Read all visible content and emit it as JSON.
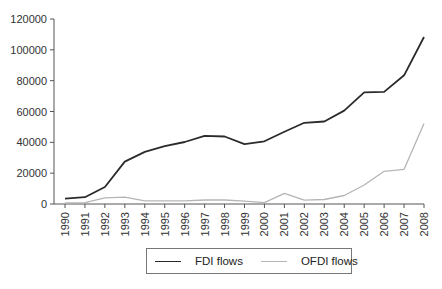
{
  "chart_data": {
    "type": "line",
    "title": "",
    "xlabel": "",
    "ylabel": "",
    "ylim": [
      0,
      120000
    ],
    "yticks": [
      0,
      20000,
      40000,
      60000,
      80000,
      100000,
      120000
    ],
    "grid": false,
    "legend_position": "bottom",
    "x": [
      "1990",
      "1991",
      "1992",
      "1993",
      "1994",
      "1995",
      "1996",
      "1997",
      "1998",
      "1999",
      "2000",
      "2001",
      "2002",
      "2003",
      "2004",
      "2005",
      "2006",
      "2007",
      "2008"
    ],
    "series": [
      {
        "name": "FDI flows",
        "color": "#2b2b2b",
        "values": [
          3500,
          4400,
          11000,
          27500,
          33800,
          37500,
          40200,
          44200,
          43800,
          38800,
          40700,
          46900,
          52700,
          53500,
          60600,
          72400,
          72700,
          83500,
          108300
        ]
      },
      {
        "name": "OFDI flows",
        "color": "#b5b5b5",
        "values": [
          800,
          900,
          4000,
          4400,
          2000,
          2000,
          2100,
          2600,
          2600,
          1800,
          900,
          6900,
          2500,
          2900,
          5500,
          12300,
          21200,
          22500,
          52200
        ]
      }
    ]
  },
  "legend": {
    "items": [
      {
        "label": "FDI flows",
        "color": "#2b2b2b"
      },
      {
        "label": "OFDI flows",
        "color": "#b5b5b5"
      }
    ]
  }
}
